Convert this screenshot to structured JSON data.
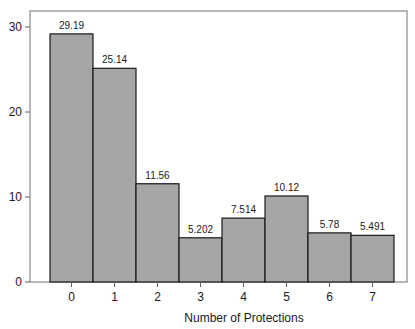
{
  "chart_data": {
    "type": "bar",
    "title": "",
    "xlabel": "Number of Protections",
    "ylabel": "",
    "categories": [
      "0",
      "1",
      "2",
      "3",
      "4",
      "5",
      "6",
      "7"
    ],
    "values": [
      29.19,
      25.14,
      11.56,
      5.202,
      7.514,
      10.12,
      5.78,
      5.491
    ],
    "data_labels": [
      "29.19",
      "25.14",
      "11.56",
      "5.202",
      "7.514",
      "10.12",
      "5.78",
      "5.491"
    ],
    "ylim": [
      0,
      31
    ],
    "yticks": [
      0,
      10,
      20,
      30
    ],
    "grid": false,
    "legend": null,
    "colors": {
      "bar_fill": "#a6a6a6",
      "bar_edge": "#1a1a1a",
      "frame": "#a0a0a0",
      "background": "#ffffff"
    }
  }
}
